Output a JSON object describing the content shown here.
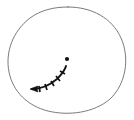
{
  "figure": {
    "title": "Hand-drawn closed curve with arrowed trajectory",
    "caption": "",
    "width": 134,
    "height": 120,
    "background_color": "#ffffff"
  },
  "colors": {
    "boundary": "#6b6b6b",
    "trajectory": "#121212",
    "point": "#121212",
    "background": "#ffffff"
  },
  "boundary": {
    "name": "closed-oval-region",
    "label": "",
    "stroke_color": "#6b6b6b",
    "stroke_width": 0.9,
    "description": "hand-drawn irregular closed oval outline",
    "path": "M 68 7 C 92 7 112 18 121 38 C 130 58 126 84 110 99 C 94 113 68 116 48 111 C 28 106 13 92 9 72 C 5 52 13 31 30 18 C 41 10 54 7 68 7 Z"
  },
  "trajectory": {
    "name": "tick-marked-path",
    "label": "",
    "stroke_color": "#121212",
    "stroke_width": 1.9,
    "description": "curved path rising to the right with transverse tick marks, arrowhead at left end",
    "path": "M 32 89 C 41 89 50 85 57 79 C 62 74 65 70 66 66"
  },
  "ticks": {
    "name": "trajectory-tick-marks",
    "count": 5,
    "stroke_color": "#121212",
    "stroke_width": 1.7,
    "marks": [
      {
        "x1": 39,
        "y1": 86,
        "x2": 40,
        "y2": 92
      },
      {
        "x1": 45,
        "y1": 84,
        "x2": 47,
        "y2": 90
      },
      {
        "x1": 51,
        "y1": 81,
        "x2": 54,
        "y2": 86
      },
      {
        "x1": 56,
        "y1": 76,
        "x2": 60,
        "y2": 81
      },
      {
        "x1": 60,
        "y1": 71,
        "x2": 65,
        "y2": 74
      }
    ]
  },
  "arrowhead": {
    "name": "left-pointing-arrowhead",
    "direction": "left",
    "tip_x": 30,
    "tip_y": 89,
    "fill_color": "#121212",
    "points": "30,89 38,86 37,89 38,92"
  },
  "point": {
    "name": "isolated-dot",
    "label": "",
    "cx": 67,
    "cy": 59,
    "r": 2.1,
    "fill_color": "#121212"
  }
}
